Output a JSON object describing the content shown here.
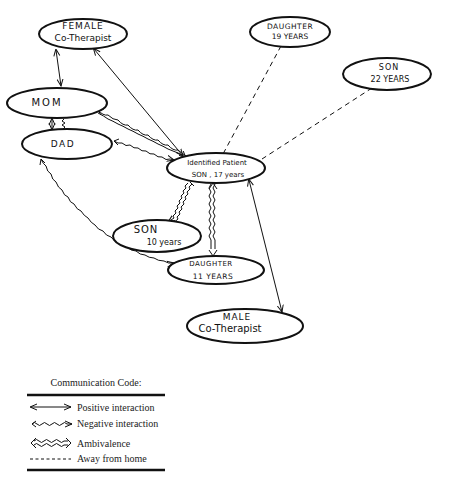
{
  "diagram": {
    "nodes": {
      "female_therapist": {
        "line1": "FEMALE",
        "line2": "Co-Therapist"
      },
      "daughter19": {
        "line1": "DAUGHTER",
        "line2": "19 YEARS"
      },
      "son22": {
        "line1": "SON",
        "line2": "22 YEARS"
      },
      "mom": {
        "line1": "MOM"
      },
      "dad": {
        "line1": "DAD"
      },
      "patient": {
        "line1": "Identified Patient",
        "line2": "SON , 17 years"
      },
      "son10": {
        "line1": "SON",
        "line2": "10 years"
      },
      "daughter11": {
        "line1": "DAUGHTER",
        "line2": "11 YEARS"
      },
      "male_therapist": {
        "line1": "MALE",
        "line2": "Co-Therapist"
      }
    },
    "edges": [
      {
        "from": "Female Co-Therapist",
        "to": "Mom",
        "type": "positive"
      },
      {
        "from": "Female Co-Therapist",
        "to": "Identified Patient",
        "type": "positive"
      },
      {
        "from": "Mom",
        "to": "Dad",
        "type": "positive"
      },
      {
        "from": "Mom",
        "to": "Dad",
        "type": "negative"
      },
      {
        "from": "Mom",
        "to": "Identified Patient",
        "type": "ambivalence"
      },
      {
        "from": "Dad",
        "to": "Identified Patient",
        "type": "negative"
      },
      {
        "from": "Dad",
        "to": "Male Co-Therapist",
        "type": "negative"
      },
      {
        "from": "Daughter 19",
        "to": "Identified Patient",
        "type": "away"
      },
      {
        "from": "Son 22",
        "to": "Identified Patient",
        "type": "away"
      },
      {
        "from": "Identified Patient",
        "to": "Son 10",
        "type": "ambivalence"
      },
      {
        "from": "Identified Patient",
        "to": "Daughter 11",
        "type": "ambivalence"
      },
      {
        "from": "Identified Patient",
        "to": "Male Co-Therapist",
        "type": "positive"
      }
    ]
  },
  "legend": {
    "title": "Communication Code:",
    "items": [
      {
        "label": "Positive interaction",
        "type": "positive"
      },
      {
        "label": "Negative interaction",
        "type": "negative"
      },
      {
        "label": "Ambivalence",
        "type": "ambivalence"
      },
      {
        "label": "Away from home",
        "type": "away"
      }
    ]
  },
  "colors": {
    "ink": "#111111",
    "background": "#ffffff"
  }
}
